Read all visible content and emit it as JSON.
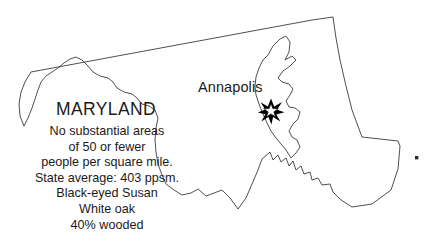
{
  "figure": {
    "name": "maryland-state-outline-map",
    "background_color": "#ffffff",
    "outline_color": "#3b3b3b",
    "text_color": "#1a1a1a",
    "width": 434,
    "height": 245
  },
  "state": {
    "name": "MARYLAND"
  },
  "capital": {
    "label": "Annapolis",
    "marker": "star-icon",
    "marker_color": "#000000"
  },
  "facts": {
    "lines": [
      "No substantial areas",
      "of 50 or fewer",
      "people per square mile.",
      "State average: 403 ppsm.",
      "Black-eyed Susan",
      "White oak",
      "40% wooded"
    ],
    "density_note": "No substantial areas of 50 or fewer people per square mile.",
    "state_average": "403 ppsm.",
    "state_flower": "Black-eyed Susan",
    "state_tree": "White oak",
    "forest_cover": "40% wooded"
  },
  "features": {
    "island_dot": "offshore-island-dot"
  }
}
